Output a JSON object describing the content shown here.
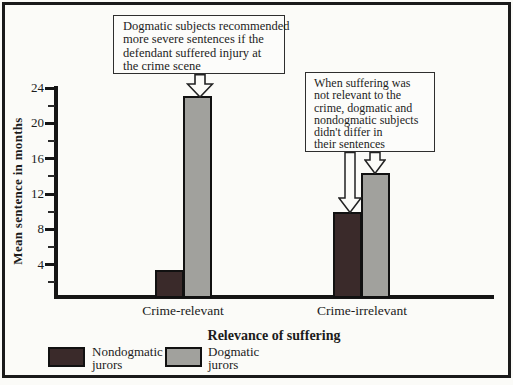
{
  "figure": {
    "background": "#fbfbf8",
    "frame_color": "#1a1a1a"
  },
  "chart_data": {
    "type": "bar",
    "title": "",
    "categories": [
      "Crime-relevant",
      "Crime-irrelevant"
    ],
    "series": [
      {
        "name": "Nondogmatic jurors",
        "color": "#3a2a2a",
        "values": [
          3.2,
          9.8
        ]
      },
      {
        "name": "Dogmatic jurors",
        "color": "#a1a19d",
        "values": [
          23,
          14.2
        ]
      }
    ],
    "xlabel": "Relevance of suffering",
    "ylabel": "Mean sentence in months",
    "ylim": [
      0,
      24
    ],
    "yticks": [
      24,
      20,
      16,
      12,
      8,
      4
    ],
    "minor_ticks_every": 2,
    "grid": false,
    "legend_position": "bottom-left",
    "annotations": [
      {
        "text": "Dogmatic subjects recommended more severe sentences if the defendant suffered injury at the crime scene",
        "target": "Crime-relevant / Dogmatic jurors bar"
      },
      {
        "text": "When suffering was not relevant to the crime, dogmatic and nondogmatic subjects didn't differ in their sentences",
        "target": "Crime-irrelevant / both bars"
      }
    ]
  },
  "axes": {
    "ylabel": "Mean sentence in months",
    "xlabel": "Relevance of suffering",
    "ytick_labels": [
      "24",
      "20",
      "16",
      "12",
      "8",
      "4"
    ],
    "category_labels": [
      "Crime-relevant",
      "Crime-irrelevant"
    ]
  },
  "callout1": {
    "lines": [
      "Dogmatic subjects recommended",
      "more severe sentences if the",
      "defendant suffered injury at",
      "the crime scene"
    ]
  },
  "callout2": {
    "lines": [
      "When suffering was",
      "not relevant to the",
      "crime, dogmatic and",
      "nondogmatic subjects",
      "didn't differ in",
      "their sentences"
    ]
  },
  "legend": {
    "items": [
      {
        "line1": "Nondogmatic",
        "line2": "jurors",
        "color": "#3a2a2a"
      },
      {
        "line1": "Dogmatic",
        "line2": "jurors",
        "color": "#a1a19d"
      }
    ]
  }
}
